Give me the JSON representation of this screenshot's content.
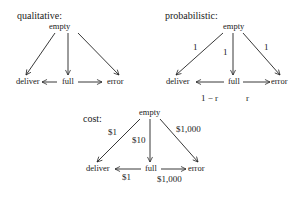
{
  "panels": [
    {
      "title": "qualitative:",
      "nodes": {
        "top": "empty",
        "left": "deliver",
        "middle": "full",
        "right": "error"
      },
      "edges": [
        {
          "from": "empty",
          "to": "deliver",
          "label": ""
        },
        {
          "from": "empty",
          "to": "full",
          "label": ""
        },
        {
          "from": "empty",
          "to": "error",
          "label": ""
        },
        {
          "from": "full",
          "to": "deliver",
          "label": ""
        },
        {
          "from": "full",
          "to": "error",
          "label": ""
        }
      ]
    },
    {
      "title": "probabilistic:",
      "nodes": {
        "top": "empty",
        "left": "deliver",
        "middle": "full",
        "right": "error"
      },
      "edges": [
        {
          "from": "empty",
          "to": "deliver",
          "label": "1"
        },
        {
          "from": "empty",
          "to": "full",
          "label": "1"
        },
        {
          "from": "empty",
          "to": "error",
          "label": "1"
        },
        {
          "from": "full",
          "to": "deliver",
          "label": "1 − r"
        },
        {
          "from": "full",
          "to": "error",
          "label": "r"
        }
      ]
    },
    {
      "title": "cost:",
      "nodes": {
        "top": "empty",
        "left": "deliver",
        "middle": "full",
        "right": "error"
      },
      "edges": [
        {
          "from": "empty",
          "to": "deliver",
          "label": "$1"
        },
        {
          "from": "empty",
          "to": "full",
          "label": "$10"
        },
        {
          "from": "empty",
          "to": "error",
          "label": "$1,000"
        },
        {
          "from": "full",
          "to": "deliver",
          "label": "$1"
        },
        {
          "from": "full",
          "to": "error",
          "label": "$1,000"
        }
      ]
    }
  ]
}
